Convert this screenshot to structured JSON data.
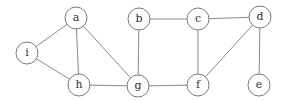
{
  "diagram": {
    "type": "undirected-graph",
    "node_radius": 11,
    "colors": {
      "edge": "#8a8a8a",
      "node_stroke": "#7a7a7a",
      "node_fill": "#ffffff",
      "label": "#333333"
    },
    "nodes": [
      {
        "id": "a",
        "label": "a",
        "x": 76,
        "y": 18
      },
      {
        "id": "b",
        "label": "b",
        "x": 139,
        "y": 19
      },
      {
        "id": "c",
        "label": "c",
        "x": 198,
        "y": 19
      },
      {
        "id": "d",
        "label": "d",
        "x": 260,
        "y": 17
      },
      {
        "id": "e",
        "label": "e",
        "x": 259,
        "y": 85
      },
      {
        "id": "f",
        "label": "f",
        "x": 198,
        "y": 85
      },
      {
        "id": "g",
        "label": "g",
        "x": 138,
        "y": 86
      },
      {
        "id": "h",
        "label": "h",
        "x": 79,
        "y": 85
      },
      {
        "id": "i",
        "label": "i",
        "x": 27,
        "y": 53
      }
    ],
    "edges": [
      [
        "i",
        "a"
      ],
      [
        "i",
        "h"
      ],
      [
        "a",
        "h"
      ],
      [
        "a",
        "g"
      ],
      [
        "h",
        "g"
      ],
      [
        "b",
        "g"
      ],
      [
        "b",
        "c"
      ],
      [
        "c",
        "d"
      ],
      [
        "c",
        "f"
      ],
      [
        "g",
        "f"
      ],
      [
        "f",
        "d"
      ],
      [
        "d",
        "e"
      ]
    ]
  }
}
